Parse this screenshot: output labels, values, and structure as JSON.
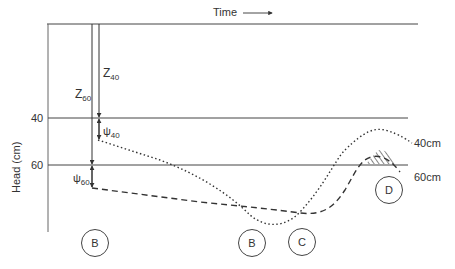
{
  "diagram": {
    "time_label": "Time",
    "y_axis_label": "Head (cm)",
    "y_ticks": [
      "40",
      "60"
    ],
    "annotations": {
      "z40": {
        "symbol": "Z",
        "sub": "40"
      },
      "z60": {
        "symbol": "Z",
        "sub": "60"
      },
      "psi40": {
        "symbol": "ψ",
        "sub": "40"
      },
      "psi60": {
        "symbol": "ψ",
        "sub": "60"
      }
    },
    "series_labels": [
      "40cm",
      "60cm"
    ],
    "markers": [
      "B",
      "B",
      "C",
      "D"
    ]
  },
  "colors": {
    "line": "#333333",
    "background": "#ffffff"
  }
}
